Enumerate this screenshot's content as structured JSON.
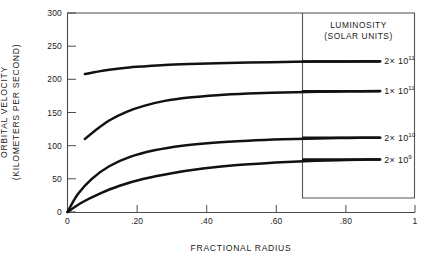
{
  "chart_data": {
    "type": "line",
    "title": "",
    "xlabel": "FRACTIONAL RADIUS",
    "ylabel": "ORBITAL VELOCITY (KILOMETERS PER SECOND)",
    "ylabel_line1": "ORBITAL  VELOCITY",
    "ylabel_line2": "(KILOMETERS PER SECOND)",
    "xlim": [
      0,
      1
    ],
    "ylim": [
      0,
      300
    ],
    "grid": false,
    "legend_position": "top-right-inset-box",
    "legend_title_line1": "LUMINOSITY",
    "legend_title_line2": "(SOLAR UNITS)",
    "xticks": [
      0,
      0.2,
      0.4,
      0.6,
      0.8,
      1
    ],
    "xtick_labels": [
      "0",
      ".20",
      ".40",
      ".60",
      ".80",
      "1"
    ],
    "yticks": [
      0,
      50,
      100,
      150,
      200,
      250,
      300
    ],
    "ytick_labels": [
      "0",
      "50",
      "100",
      "150",
      "200",
      "250",
      "300"
    ],
    "series": [
      {
        "name": "2 x 10^11",
        "label_mantissa": "2",
        "label_times": "×",
        "label_base": "10",
        "label_exponent": "11",
        "color": "#111111",
        "x": [
          0.05,
          0.08,
          0.12,
          0.17,
          0.22,
          0.28,
          0.35,
          0.43,
          0.52,
          0.62,
          0.72,
          0.81,
          0.9
        ],
        "values": [
          208,
          211,
          214.5,
          217.5,
          219.5,
          221.5,
          223,
          224.3,
          225.3,
          226.1,
          226.7,
          227,
          227.3
        ]
      },
      {
        "name": "1 x 10^11",
        "label_mantissa": "1",
        "label_times": "×",
        "label_base": "10",
        "label_exponent": "11",
        "color": "#111111",
        "x": [
          0.05,
          0.08,
          0.12,
          0.17,
          0.22,
          0.28,
          0.35,
          0.43,
          0.52,
          0.62,
          0.72,
          0.81,
          0.9
        ],
        "values": [
          110,
          123,
          138,
          151,
          160,
          167.5,
          172.5,
          176,
          178.5,
          180.3,
          181.3,
          182,
          182.5
        ]
      },
      {
        "name": "2 x 10^10",
        "label_mantissa": "2",
        "label_times": "×",
        "label_base": "10",
        "label_exponent": "10",
        "color": "#111111",
        "x": [
          0,
          0.03,
          0.07,
          0.12,
          0.18,
          0.25,
          0.33,
          0.42,
          0.52,
          0.62,
          0.72,
          0.81,
          0.9
        ],
        "values": [
          0,
          27,
          50,
          69,
          83,
          93,
          100,
          104.5,
          107.5,
          109.5,
          110.8,
          111.6,
          112
        ]
      },
      {
        "name": "2 x 10^9",
        "label_mantissa": "2",
        "label_times": "×",
        "label_base": "10",
        "label_exponent": "9",
        "color": "#111111",
        "x": [
          0,
          0.04,
          0.09,
          0.15,
          0.22,
          0.3,
          0.39,
          0.48,
          0.58,
          0.68,
          0.78,
          0.85,
          0.9
        ],
        "values": [
          0,
          14,
          27,
          39.5,
          50,
          58.5,
          65.5,
          70.5,
          74,
          76.5,
          78.2,
          78.9,
          79.3
        ]
      }
    ],
    "legend_keys": [
      {
        "label_value": 227,
        "line_x_start": 0.675,
        "line_x_end": 0.9
      },
      {
        "label_value": 182,
        "line_x_start": 0.675,
        "line_x_end": 0.9
      },
      {
        "label_value": 112,
        "line_x_start": 0.675,
        "line_x_end": 0.9
      },
      {
        "label_value": 79,
        "line_x_start": 0.675,
        "line_x_end": 0.9
      }
    ]
  },
  "colors": {
    "curve": "#111111",
    "axis": "#4a4a4a",
    "legend_border": "#555555",
    "background": "#ffffff",
    "text": "#1a1a1a"
  }
}
